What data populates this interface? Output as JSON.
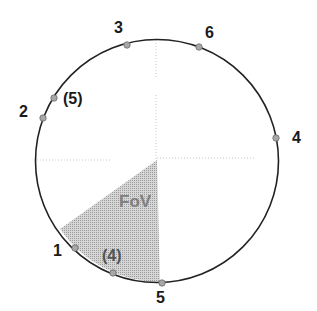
{
  "diagram": {
    "type": "circle-field-of-view",
    "fov_label": "FoV",
    "colors": {
      "circle": "#222222",
      "fov_fill": "#bdbdbd",
      "marker": "#9a9a9a",
      "axis": "#c8c8c8"
    },
    "points": [
      {
        "label": "1",
        "x": 75,
        "y": 248,
        "lx": 53,
        "ly": 243
      },
      {
        "label": "2",
        "x": 43,
        "y": 118,
        "lx": 19,
        "ly": 104
      },
      {
        "label": "3",
        "x": 127,
        "y": 45,
        "lx": 114,
        "ly": 20
      },
      {
        "label": "4",
        "x": 276,
        "y": 138,
        "lx": 292,
        "ly": 130
      },
      {
        "label": "5",
        "x": 162,
        "y": 283,
        "lx": 156,
        "ly": 290
      },
      {
        "label": "6",
        "x": 199,
        "y": 47,
        "lx": 205,
        "ly": 25
      },
      {
        "label": "(5)",
        "x": 54,
        "y": 98,
        "lx": 63,
        "ly": 91
      },
      {
        "label": "(4)",
        "x": 113,
        "y": 273,
        "lx": 102,
        "ly": 248
      }
    ]
  }
}
